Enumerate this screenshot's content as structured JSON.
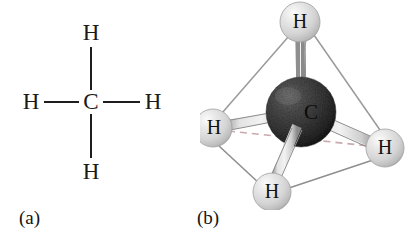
{
  "figure": {
    "background_color": "#ffffff",
    "width": 417,
    "height": 232
  },
  "panel_a": {
    "caption": "(a)",
    "description": "Two-dimensional structural formula of methane showing a central carbon bonded to four hydrogen atoms",
    "center_atom": {
      "symbol": "C",
      "x": 91,
      "y": 102
    },
    "atoms": [
      {
        "symbol": "H",
        "position": "top",
        "x": 91,
        "y": 33
      },
      {
        "symbol": "H",
        "position": "left",
        "x": 31,
        "y": 102
      },
      {
        "symbol": "H",
        "position": "right",
        "x": 153,
        "y": 102
      },
      {
        "symbol": "H",
        "position": "bottom",
        "x": 91,
        "y": 172
      }
    ],
    "bonds": [
      {
        "from": "C",
        "to": "H-top",
        "style": "solid-line"
      },
      {
        "from": "C",
        "to": "H-left",
        "style": "solid-line"
      },
      {
        "from": "C",
        "to": "H-right",
        "style": "solid-line"
      },
      {
        "from": "C",
        "to": "H-bottom",
        "style": "solid-line"
      }
    ],
    "bond_color": "#1d1d1d"
  },
  "panel_b": {
    "caption": "(b)",
    "description": "Three-dimensional ball-and-stick model of methane showing tetrahedral geometry with the carbon at the center of a tetrahedron outlined by the four hydrogen atoms",
    "carbon": {
      "symbol": "C",
      "cx": 101,
      "cy": 112,
      "r": 35,
      "color": "#3a3a3a",
      "highlight_color": "#6b6b6b",
      "shadow_color": "#151515"
    },
    "hydrogens": [
      {
        "symbol": "H",
        "position": "top",
        "cx": 100,
        "cy": 22,
        "r": 20
      },
      {
        "symbol": "H",
        "position": "front-left",
        "cx": 13,
        "cy": 128,
        "r": 19
      },
      {
        "symbol": "H",
        "position": "front-bottom",
        "cx": 72,
        "cy": 192,
        "r": 19
      },
      {
        "symbol": "H",
        "position": "front-right",
        "cx": 185,
        "cy": 148,
        "r": 19
      }
    ],
    "hydrogen_color": "#d9d9d9",
    "hydrogen_highlight_color": "#f4f4f4",
    "hydrogen_shadow_color": "#a8a8a8",
    "bond_color": "#c9c9c9",
    "bond_edge_color": "#8c8c8c",
    "tetrahedron_edge_color": "#9a9a9a",
    "hidden_edge_color": "#c9a9ad",
    "bonds": [
      {
        "from": "C",
        "to": "H-top",
        "style": "cylinder"
      },
      {
        "from": "C",
        "to": "H-front-left",
        "style": "cylinder"
      },
      {
        "from": "C",
        "to": "H-front-bottom",
        "style": "cylinder"
      },
      {
        "from": "C",
        "to": "H-front-right",
        "style": "cylinder"
      }
    ],
    "tetrahedron_edges": [
      {
        "from": "H-top",
        "to": "H-front-left",
        "style": "solid"
      },
      {
        "from": "H-top",
        "to": "H-front-right",
        "style": "solid"
      },
      {
        "from": "H-top",
        "to": "H-front-bottom",
        "style": "solid"
      },
      {
        "from": "H-front-left",
        "to": "H-front-bottom",
        "style": "solid"
      },
      {
        "from": "H-front-bottom",
        "to": "H-front-right",
        "style": "solid"
      },
      {
        "from": "H-front-left",
        "to": "H-front-right",
        "style": "dashed"
      }
    ]
  }
}
